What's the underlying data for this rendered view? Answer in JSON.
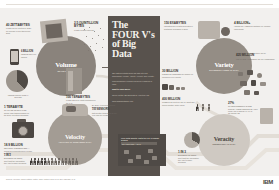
{
  "meta": {
    "title": "The FOUR V's of Big Data",
    "brand": "IBM",
    "palette": {
      "background": "#f2f0ee",
      "center_column": "#58524d",
      "volume": "#8a837c",
      "variety": "#948d85",
      "velocity": "#a39c94",
      "veracity": "#cfc9c2",
      "text_dark": "#3a3633",
      "text_muted": "#6b6660"
    }
  },
  "center": {
    "title_lines": [
      "The",
      "FOUR V's",
      "of Big",
      "Data"
    ],
    "paragraphs": [
      {
        "hd": false,
        "text": "IBM data scientists break big data into four dimensions: Volume, Variety, Velocity and Veracity."
      },
      {
        "hd": false,
        "text": "This infographic explains and gives examples of each."
      },
      {
        "hd": true,
        "text": "Want to learn more?"
      },
      {
        "hd": false,
        "text": "Check out the IBM Big Data & Analytics Hub"
      },
      {
        "hd": false,
        "text": "www.ibmbigdatahub.com"
      }
    ]
  },
  "sections": [
    {
      "id": "volume",
      "name": "Volume",
      "subtitle": "SCALE OF DATA",
      "facts": [
        {
          "big": "40 ZETTABYTES",
          "lines": [
            "of data will be created by",
            "2020, an increase of 300",
            "times from 2005"
          ]
        },
        {
          "big": "2.5 QUINTILLION BYTES",
          "lines": [
            "of data created each day"
          ]
        },
        {
          "big": "6 BILLION",
          "lines": [
            "PEOPLE",
            "have cell",
            "phones"
          ]
        },
        {
          "big": "100 TERABYTES",
          "lines": [
            "of data stored by most",
            "companies in the U.S."
          ]
        },
        {
          "big": "WORLD POPULATION: 7 BILLION",
          "lines": []
        },
        {
          "big": "30 BILLION",
          "lines": [
            "PIECES OF CONTENT",
            "are shared on Facebook",
            "every month"
          ]
        },
        {
          "big": "420 MILLION",
          "lines": [
            "WEARABLE, WIRELESS HEALTH",
            "MONITORS by 2014"
          ]
        }
      ]
    },
    {
      "id": "variety",
      "name": "Variety",
      "subtitle": "DIFFERENT FORMS OF DATA",
      "facts": [
        {
          "big": "150 EXABYTES",
          "lines": [
            "estimated size of data",
            "generated in healthcare",
            "worldwide in 2011"
          ]
        },
        {
          "big": "4 BILLION+",
          "lines": [
            "HOURS OF VIDEO",
            "are watched on",
            "YouTube each month"
          ]
        },
        {
          "big": "30 BILLION",
          "lines": [
            "PIECES OF CONTENT",
            "are shared on Facebook",
            "every month"
          ]
        },
        {
          "big": "400 MILLION",
          "lines": [
            "TWEETS",
            "are sent per day by about",
            "200 million monthly active users"
          ]
        },
        {
          "big": "By 2014, it's anticipated there will be",
          "lines": [
            "420 MILLION",
            "WEARABLE, WIRELESS",
            "HEALTH MONITORS"
          ]
        }
      ]
    },
    {
      "id": "velocity",
      "name": "Velocity",
      "subtitle": "ANALYSIS OF STREAMING DATA",
      "facts": [
        {
          "big": "1 TERABYTE",
          "lines": [
            "OF TRADE INFORMATION",
            "during each trading session",
            "on the New York Stock Exchange"
          ]
        },
        {
          "big": "18.9 BILLION",
          "lines": [
            "NETWORK CONNECTIONS",
            "— almost 2.5 connections",
            "per person on earth"
          ]
        },
        {
          "big": "By 2016, it is projected there will be",
          "lines": [
            "MODERN CARS HAVE CLOSE TO",
            "100 SENSORS",
            "that monitor items such as",
            "fuel level and tire pressure"
          ]
        }
      ]
    },
    {
      "id": "veracity",
      "name": "Veracity",
      "subtitle": "UNCERTAINTY OF DATA",
      "facts": [
        {
          "big": "1 IN 3",
          "lines": [
            "BUSINESS LEADERS",
            "don't trust the information",
            "they use to make decisions"
          ]
        },
        {
          "big": "27%",
          "lines": [
            "OF RESPONDENTS IN ONE",
            "SURVEY WERE UNSURE OF",
            "HOW MUCH OF THEIR DATA",
            "WAS INACCURATE"
          ]
        },
        {
          "big": "$3.1 TRILLION",
          "lines": [
            "A YEAR",
            "Poor data quality costs the",
            "US economy around"
          ]
        }
      ]
    }
  ],
  "pictogram": {
    "heading": "1 IN 3",
    "lines": [
      "BUSINESS LEADERS",
      "don't trust the information",
      "they use to make decisions"
    ],
    "total": 14,
    "highlighted": 5
  },
  "dark_panel": {
    "title": "Poor data quality costs the US economy around",
    "value": "$3.1 TRILLION A YEAR"
  },
  "footer": {
    "source": "Sources: McKinsey Global Institute, Twitter, Cisco, Gartner, EMC, SAS, IBM, MEPTEC, QAS",
    "logo": "IBM"
  }
}
